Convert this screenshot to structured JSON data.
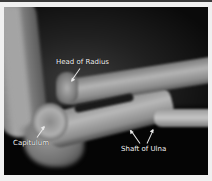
{
  "image": {
    "type": "x-ray",
    "subject": "lateral elbow radiograph"
  },
  "labels": [
    {
      "id": "head-of-radius",
      "text": "Head of Radius"
    },
    {
      "id": "capitulum",
      "text": "Capitulum"
    },
    {
      "id": "shaft-of-ulna",
      "text": "Shaft of Ulna"
    }
  ]
}
